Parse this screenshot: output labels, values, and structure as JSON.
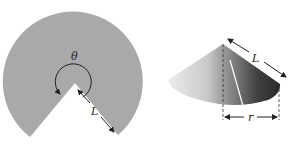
{
  "figure": {
    "sector": {
      "angle_label": "θ",
      "radius_label": "L",
      "fill": "#a9a9a9"
    },
    "cone": {
      "slant_label": "L",
      "radius_label": "r",
      "fill_light": "#e6e6e6",
      "fill_dark": "#3c3c3c"
    }
  }
}
